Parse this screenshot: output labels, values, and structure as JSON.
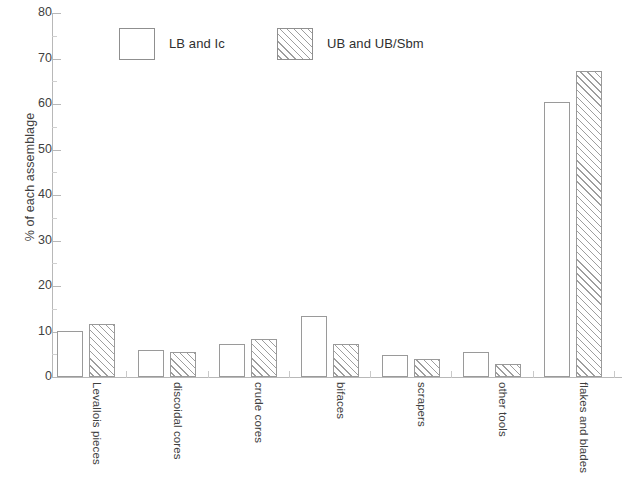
{
  "chart_data": {
    "type": "bar",
    "title": "",
    "xlabel": "",
    "ylabel": "% of each assemblage",
    "ylim": [
      0,
      80
    ],
    "ytick_step": 10,
    "grid": false,
    "legend_position": "top-center",
    "categories": [
      "Levallois pieces",
      "discoidal cores",
      "crude cores",
      "bifaces",
      "scrapers",
      "other tools",
      "flakes and blades"
    ],
    "ytick_labels": [
      "0",
      "10",
      "20",
      "30",
      "40",
      "50",
      "60",
      "70",
      "80"
    ],
    "series": [
      {
        "name": "LB and Ic",
        "fill": "solid-white",
        "values": [
          10.2,
          5.9,
          7.2,
          13.4,
          4.8,
          5.5,
          60.4
        ]
      },
      {
        "name": "UB and UB/Sbm",
        "fill": "diagonal-hatch",
        "values": [
          11.6,
          5.6,
          8.3,
          7.3,
          4.0,
          2.9,
          67.3
        ]
      }
    ],
    "colors": {
      "axis": "#b8b8b8",
      "bar_outline": "#9a9a9a",
      "bar_fill": "#ffffff",
      "hatch": "#9e9e9e",
      "text": "#3f3f3f",
      "background": "#ffffff"
    }
  },
  "legend": {
    "items": [
      {
        "label": "LB and Ic",
        "fill": "solid-white"
      },
      {
        "label": "UB and UB/Sbm",
        "fill": "diagonal-hatch"
      }
    ]
  }
}
